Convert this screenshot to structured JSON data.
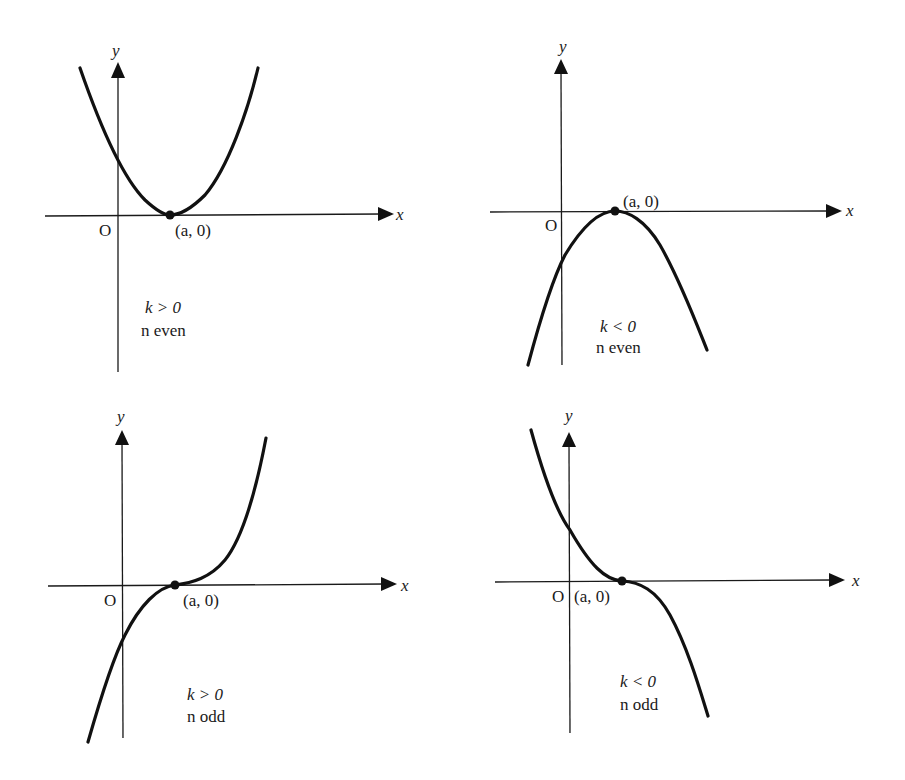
{
  "figure": {
    "panels": [
      {
        "id": "kpos-neven",
        "x_label": "x",
        "y_label": "y",
        "origin_label": "O",
        "point_label": "(a, 0)",
        "condition_k": "k > 0",
        "condition_n": "n even",
        "shape": "parabola opening upward, touching x-axis at (a, 0)"
      },
      {
        "id": "kneg-neven",
        "x_label": "x",
        "y_label": "y",
        "origin_label": "O",
        "point_label": "(a, 0)",
        "condition_k": "k < 0",
        "condition_n": "n even",
        "shape": "parabola opening downward, touching x-axis at (a, 0)"
      },
      {
        "id": "kpos-nodd",
        "x_label": "x",
        "y_label": "y",
        "origin_label": "O",
        "point_label": "(a, 0)",
        "condition_k": "k > 0",
        "condition_n": "n odd",
        "shape": "increasing cubic-like curve with inflection at (a, 0)"
      },
      {
        "id": "kneg-nodd",
        "x_label": "x",
        "y_label": "y",
        "origin_label": "O",
        "point_label": "(a, 0)",
        "condition_k": "k < 0",
        "condition_n": "n odd",
        "shape": "decreasing cubic-like curve with inflection at (a, 0)"
      }
    ]
  },
  "colors": {
    "ink": "#111111",
    "background": "#ffffff"
  }
}
